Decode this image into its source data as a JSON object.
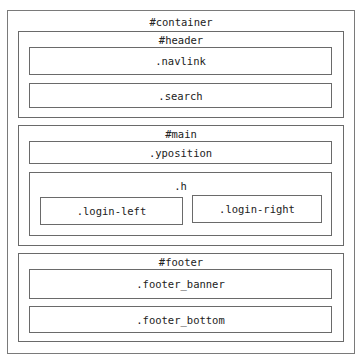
{
  "diagram": {
    "container": {
      "label": "#container"
    },
    "header": {
      "label": "#header",
      "children": [
        ".navlink",
        ".search"
      ]
    },
    "main": {
      "label": "#main",
      "yposition": ".yposition",
      "h": {
        "label": ".h",
        "children": [
          ".login-left",
          ".login-right"
        ]
      }
    },
    "footer": {
      "label": "#footer",
      "children": [
        ".footer_banner",
        ".footer_bottom"
      ]
    }
  }
}
